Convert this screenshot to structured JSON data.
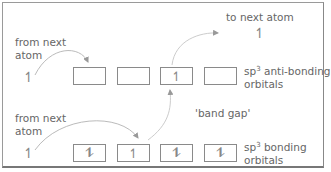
{
  "labels": {
    "from_next_atom_top": "from next\natom",
    "from_next_atom_top_l1": "from next",
    "from_next_atom_top_l2": "atom",
    "from_next_atom_bottom_l1": "from next",
    "from_next_atom_bottom_l2": "atom",
    "to_next_atom": "to next atom",
    "band_gap": "'band gap'",
    "antibonding_prefix": "sp",
    "antibonding_sup": "3",
    "antibonding_suffix": " anti-bonding",
    "antibonding_l2": "orbitals",
    "bonding_prefix": "sp",
    "bonding_sup": "3",
    "bonding_suffix": " bonding",
    "bonding_l2": "orbitals"
  },
  "spins": {
    "left_top": "↿",
    "left_bottom": "↿",
    "to_next_atom": "↿"
  },
  "antibonding_boxes": [
    "",
    "",
    "↿",
    ""
  ],
  "bonding_boxes": [
    "⥮",
    "↿",
    "⥮",
    "⥮"
  ],
  "colors": {
    "line": "#8a8a8a",
    "text": "#666666",
    "arrow": "#b0b0b0"
  }
}
